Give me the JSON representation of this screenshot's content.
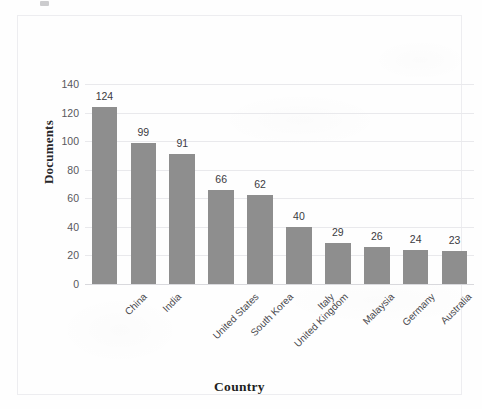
{
  "chart_data": {
    "type": "bar",
    "title": "",
    "subtitle": "",
    "xlabel": "Country",
    "ylabel": "Documents",
    "categories": [
      "China",
      "India",
      "United States",
      "South Korea",
      "United Kingdom",
      "Italy",
      "Malaysia",
      "Germany",
      "Australia",
      "United Arab Emirates"
    ],
    "values": [
      124,
      99,
      91,
      66,
      62,
      40,
      29,
      26,
      24,
      23
    ],
    "data_labels": [
      "124",
      "99",
      "91",
      "66",
      "62",
      "40",
      "29",
      "26",
      "24",
      "23"
    ],
    "ylim": [
      0,
      140
    ],
    "yticks": [
      0,
      20,
      40,
      60,
      80,
      100,
      120,
      140
    ],
    "ytick_labels": [
      "0",
      "20",
      "40",
      "60",
      "80",
      "100",
      "120",
      "140"
    ],
    "grid": true,
    "grid_axis": "y",
    "legend": false,
    "legend_position": "none",
    "bar_color": "#8e8e8e",
    "grid_color": "#e9e9ec",
    "axis_color": "#d9d9dd",
    "label_rotation": -45,
    "border_color": "#ededf0"
  }
}
